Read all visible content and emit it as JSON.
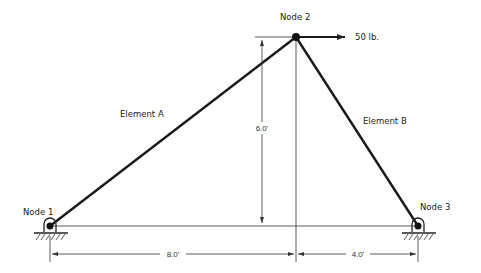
{
  "diagram": {
    "type": "truss",
    "nodes": [
      {
        "id": "node1",
        "label": "Node 1"
      },
      {
        "id": "node2",
        "label": "Node 2"
      },
      {
        "id": "node3",
        "label": "Node 3"
      }
    ],
    "elements": [
      {
        "id": "A",
        "label": "Element A",
        "from": "node1",
        "to": "node2"
      },
      {
        "id": "B",
        "label": "Element B",
        "from": "node2",
        "to": "node3"
      }
    ],
    "load": {
      "label": "50 lb.",
      "at": "node2",
      "direction": "right"
    },
    "dimensions": {
      "height": "6.0'",
      "left_span": "8.0'",
      "right_span": "4.0'"
    },
    "supports": [
      "pin",
      "pin"
    ],
    "colors": {
      "line": "#1a1a1a",
      "background": "#ffffff"
    }
  }
}
